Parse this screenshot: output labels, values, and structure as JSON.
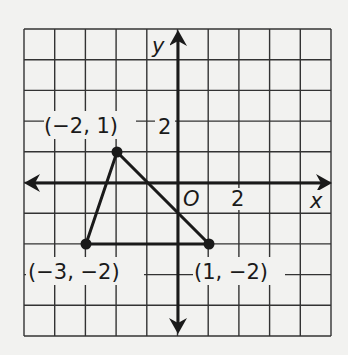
{
  "diagram": {
    "type": "coordinate-plane-triangle",
    "grid": {
      "x_min": -5,
      "x_max": 5,
      "y_min": -5,
      "y_max": 5,
      "unit_px": 30.7
    },
    "axes": {
      "x_label": "x",
      "y_label": "y",
      "origin_label": "O",
      "x_tick_label": "2",
      "y_tick_label": "2"
    },
    "vertices": [
      {
        "x": -2,
        "y": 1,
        "label": "(−2, 1)"
      },
      {
        "x": -3,
        "y": -2,
        "label": "(−3, −2)"
      },
      {
        "x": 1,
        "y": -2,
        "label": "(1, −2)"
      }
    ],
    "colors": {
      "ink": "#1a1a1a",
      "grid": "#333333",
      "background": "#f2f2f0"
    }
  }
}
